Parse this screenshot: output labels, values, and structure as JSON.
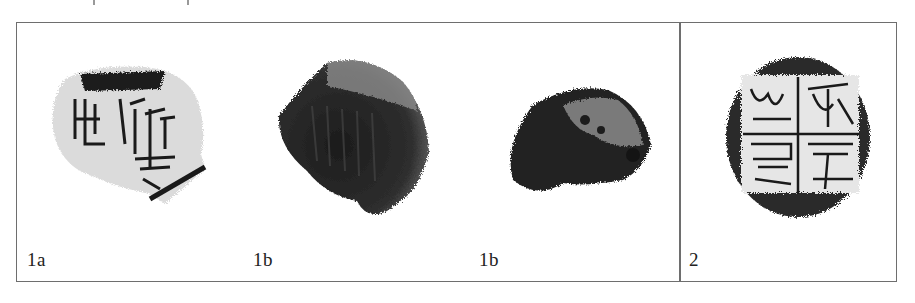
{
  "figure": {
    "panels": [
      {
        "id": "1a",
        "label": "1a",
        "type": "rubbing",
        "description": "seal impression rubbing, fragmentary, with characters in square frame"
      },
      {
        "id": "1b-front",
        "label": "1b",
        "type": "photograph",
        "description": "clay sealing, inscribed face"
      },
      {
        "id": "1b-back",
        "label": "1b",
        "type": "photograph",
        "description": "clay sealing, reverse side"
      },
      {
        "id": "2",
        "label": "2",
        "type": "rubbing",
        "description": "seal impression rubbing, four characters divided by cross lines"
      }
    ],
    "colors": {
      "frame": "#6e6e6e",
      "ink": "#1a1a1a",
      "clay_dark": "#2a2a2a",
      "clay_light": "#8a8a8a"
    }
  }
}
